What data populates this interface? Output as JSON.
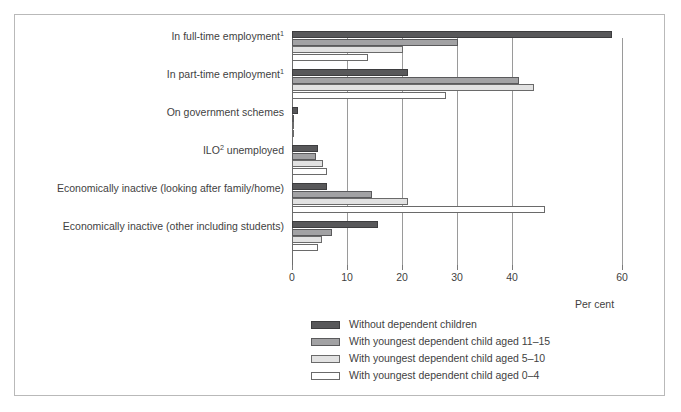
{
  "chart_data": {
    "type": "bar",
    "orientation": "horizontal",
    "title": "",
    "xlabel": "Per cent",
    "ylabel": "",
    "xlim": [
      0,
      60
    ],
    "xticks": [
      0,
      10,
      20,
      30,
      40,
      60
    ],
    "xticklabels": [
      "0",
      "10",
      "20",
      "30",
      "40",
      "60"
    ],
    "grid": true,
    "legend_position": "bottom",
    "categories": [
      "In full-time employment¹",
      "In part-time employment¹",
      "On government schemes",
      "ILO² unemployed",
      "Economically inactive (looking after family/home)",
      "Economically inactive (other including students)"
    ],
    "categories_rich": [
      {
        "text": "In full-time employment",
        "sup": "1"
      },
      {
        "text": "In part-time employment",
        "sup": "1"
      },
      {
        "text": "On government schemes",
        "sup": ""
      },
      {
        "text": "ILO",
        "sup": "2",
        "tail": " unemployed"
      },
      {
        "text": "Economically inactive (looking after family/home)",
        "sup": ""
      },
      {
        "text": "Economically inactive (other including students)",
        "sup": ""
      }
    ],
    "series": [
      {
        "name": "Without dependent children",
        "color": "#58585a",
        "values": [
          58.2,
          21.0,
          1.0,
          4.7,
          6.3,
          15.6
        ]
      },
      {
        "name": "With youngest dependent child aged 11–15",
        "color": "#a2a2a4",
        "values": [
          30.2,
          41.3,
          0.4,
          4.3,
          14.6,
          7.2
        ]
      },
      {
        "name": "With youngest dependent child aged 5–10",
        "color": "#e2e2e2",
        "values": [
          20.2,
          44.0,
          0.3,
          5.6,
          21.0,
          5.5
        ]
      },
      {
        "name": "With youngest dependent child aged 0–4",
        "color": "#ffffff",
        "values": [
          13.8,
          28.0,
          0.2,
          6.3,
          46.0,
          4.8
        ]
      }
    ]
  }
}
